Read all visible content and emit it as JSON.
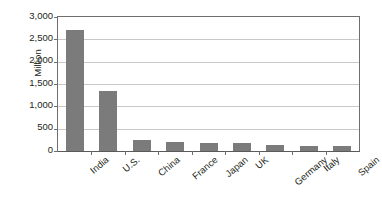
{
  "chart_data": {
    "type": "bar",
    "title": "",
    "subtitle": "",
    "xlabel": "",
    "ylabel": "Million",
    "categories": [
      "India",
      "U.S.",
      "China",
      "France",
      "Japan",
      "UK",
      "Germany",
      "Italy",
      "Spain"
    ],
    "values": [
      2700,
      1340,
      245,
      210,
      175,
      170,
      125,
      110,
      105
    ],
    "series": [
      {
        "name": "Million",
        "values": [
          2700,
          1340,
          245,
          210,
          175,
          170,
          125,
          110,
          105
        ]
      }
    ],
    "ylim": [
      0,
      3000
    ],
    "ytick_values": [
      0,
      500,
      1000,
      1500,
      2000,
      2500,
      3000
    ],
    "ytick_labels": [
      "0",
      "500",
      "1,000",
      "1,500",
      "2,000",
      "2,500",
      "3,000"
    ],
    "grid": true,
    "grid_axis": "y",
    "legend": false,
    "legend_position": "none",
    "bar_color": "#7b7b7b",
    "gridline_color": "#c8c8c8",
    "axis_color": "#6f6f6f",
    "text_color": "#231f20",
    "background_color": "#ffffff",
    "xtick_label_rotation": -40,
    "annotations": []
  }
}
